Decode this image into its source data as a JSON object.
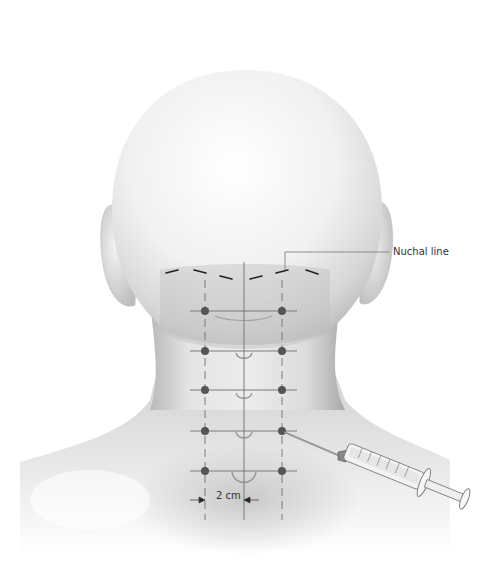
{
  "figure": {
    "type": "medical-illustration",
    "labels": {
      "nuchal_line": "Nuchal line",
      "scale": "2 cm"
    },
    "grid": {
      "columns_x": [
        205,
        282
      ],
      "midline_x": 244,
      "rows_y": [
        311,
        351,
        390,
        431,
        471
      ],
      "dot_color": "#555555",
      "line_color": "#777777"
    },
    "injection_point": {
      "column": 1,
      "row": 3
    },
    "colors": {
      "background": "#ffffff",
      "skin_light": "#f4f4f4",
      "skin_shade": "#c8c8c8",
      "neck_shade": "#b5b5b5",
      "text": "#333333"
    }
  }
}
